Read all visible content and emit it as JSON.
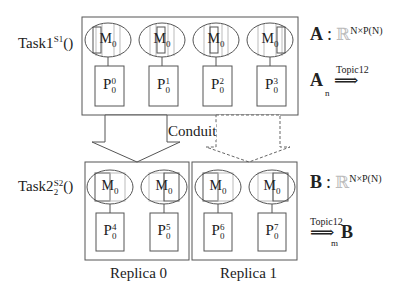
{
  "diagram": {
    "top_task": {
      "name": "Task1",
      "sup": "S1",
      "suffix": "()"
    },
    "bottom_task": {
      "name": "Task2",
      "sup": "S2",
      "sub": "2",
      "suffix": "()"
    },
    "top_nodes": [
      {
        "m": "M",
        "m_sub": "0",
        "p": "P",
        "p_sub": "0",
        "p_sup": "0"
      },
      {
        "m": "M",
        "m_sub": "0",
        "p": "P",
        "p_sub": "0",
        "p_sup": "1"
      },
      {
        "m": "M",
        "m_sub": "0",
        "p": "P",
        "p_sub": "0",
        "p_sup": "2"
      },
      {
        "m": "M",
        "m_sub": "0",
        "p": "P",
        "p_sub": "0",
        "p_sup": "3"
      }
    ],
    "bottom_nodes": [
      {
        "m": "M",
        "m_sub": "0",
        "p": "P",
        "p_sub": "0",
        "p_sup": "4"
      },
      {
        "m": "M",
        "m_sub": "0",
        "p": "P",
        "p_sub": "0",
        "p_sup": "5"
      },
      {
        "m": "M",
        "m_sub": "0",
        "p": "P",
        "p_sub": "0",
        "p_sup": "6"
      },
      {
        "m": "M",
        "m_sub": "0",
        "p": "P",
        "p_sub": "0",
        "p_sup": "7"
      }
    ],
    "conduit_label": "Conduit",
    "replicas": [
      "Replica 0",
      "Replica 1"
    ],
    "annotations": {
      "a_type": {
        "var": "A",
        "colon": ":",
        "real": "ℝ",
        "dims": "N×P(N)"
      },
      "a_publish": {
        "var": "A",
        "sub": "n",
        "topic": "Topic12",
        "arrow": "⟹"
      },
      "b_type": {
        "var": "B",
        "colon": ":",
        "real": "ℝ",
        "dims": "N×P(N)"
      },
      "b_subscribe": {
        "var": "B",
        "sub": "m",
        "topic": "Topic12",
        "arrow": "⟹"
      }
    },
    "colors": {
      "line": "#555555",
      "light_line": "#aaaaaa",
      "dashed": "#666666"
    }
  }
}
